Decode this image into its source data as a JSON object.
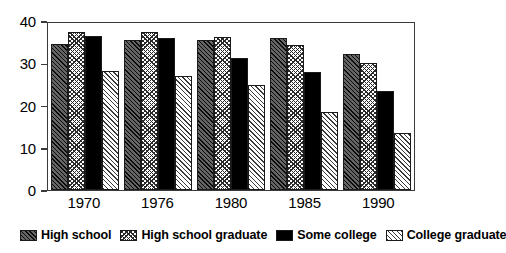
{
  "chart_data": {
    "type": "bar",
    "title": "",
    "subtitle": "",
    "xlabel": "",
    "ylabel": "",
    "categories": [
      "1970",
      "1976",
      "1980",
      "1985",
      "1990"
    ],
    "ylim": [
      0,
      40
    ],
    "yticks": [
      0,
      10,
      20,
      30,
      40
    ],
    "ytick_labels": [
      "0",
      "10",
      "20",
      "30",
      "40"
    ],
    "grid": false,
    "legend_position": "bottom",
    "series": [
      {
        "name": "High school",
        "pattern": "diagonal-hatch-dark",
        "color": "#4a4a4a",
        "values": [
          34.6,
          35.6,
          35.6,
          36.0,
          32.2
        ]
      },
      {
        "name": "High school graduate",
        "pattern": "crosshatch-light",
        "color": "#ffffff",
        "values": [
          37.3,
          37.5,
          36.1,
          34.4,
          30.0
        ]
      },
      {
        "name": "Some college",
        "pattern": "solid-black",
        "color": "#000000",
        "values": [
          36.4,
          36.0,
          31.2,
          28.0,
          23.4
        ]
      },
      {
        "name": "College graduate",
        "pattern": "diagonal-hatch-light",
        "color": "#ffffff",
        "values": [
          28.2,
          27.1,
          24.9,
          18.5,
          13.6
        ]
      }
    ]
  }
}
